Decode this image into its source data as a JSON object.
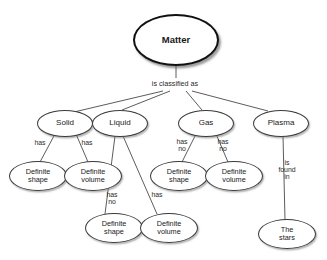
{
  "diagram": {
    "background_color": "#ffffff",
    "node_border_color": "#3a3a3a",
    "root_border_color": "#111111",
    "text_color": "#1a1a1a",
    "nodes": [
      {
        "id": "matter",
        "label": "Matter",
        "x": 133,
        "y": 14,
        "w": 86,
        "h": 52,
        "font_size": 9.5,
        "root": true
      },
      {
        "id": "solid",
        "label": "Solid",
        "x": 37,
        "y": 110,
        "w": 56,
        "h": 27,
        "font_size": 8.0,
        "root": false
      },
      {
        "id": "liquid",
        "label": "Liquid",
        "x": 92,
        "y": 110,
        "w": 56,
        "h": 27,
        "font_size": 8.0,
        "root": false
      },
      {
        "id": "gas",
        "label": "Gas",
        "x": 178,
        "y": 110,
        "w": 56,
        "h": 27,
        "font_size": 8.0,
        "root": false
      },
      {
        "id": "plasma",
        "label": "Plasma",
        "x": 253,
        "y": 110,
        "w": 56,
        "h": 27,
        "font_size": 8.0,
        "root": false
      },
      {
        "id": "solid-shape",
        "label": "Definite\nshape",
        "x": 9,
        "y": 161,
        "w": 58,
        "h": 30,
        "font_size": 7.3,
        "root": false
      },
      {
        "id": "solid-volume",
        "label": "Definite\nvolume",
        "x": 64,
        "y": 161,
        "w": 58,
        "h": 30,
        "font_size": 7.3,
        "root": false
      },
      {
        "id": "gas-shape",
        "label": "Definite\nshape",
        "x": 150,
        "y": 161,
        "w": 58,
        "h": 30,
        "font_size": 7.3,
        "root": false
      },
      {
        "id": "gas-volume",
        "label": "Definite\nvolume",
        "x": 205,
        "y": 161,
        "w": 58,
        "h": 30,
        "font_size": 7.3,
        "root": false
      },
      {
        "id": "liquid-shape",
        "label": "Definite\nshape",
        "x": 85,
        "y": 213,
        "w": 58,
        "h": 30,
        "font_size": 7.3,
        "root": false
      },
      {
        "id": "liquid-volume",
        "label": "Definite\nvolume",
        "x": 140,
        "y": 213,
        "w": 58,
        "h": 30,
        "font_size": 7.3,
        "root": false
      },
      {
        "id": "stars",
        "label": "The\nstars",
        "x": 258,
        "y": 219,
        "w": 58,
        "h": 30,
        "font_size": 7.3,
        "root": false
      }
    ],
    "edge_labels": [
      {
        "id": "classified",
        "text": "is classified as",
        "x": 139,
        "y": 80,
        "w": 72,
        "font_size": 7.2
      },
      {
        "id": "solid-has-1",
        "text": "has",
        "x": 29,
        "y": 140,
        "w": 22,
        "font_size": 6.9
      },
      {
        "id": "solid-has-2",
        "text": "has",
        "x": 76,
        "y": 140,
        "w": 22,
        "font_size": 6.9
      },
      {
        "id": "gas-hasno-1",
        "text": "has\nno",
        "x": 171,
        "y": 139,
        "w": 22,
        "font_size": 6.9
      },
      {
        "id": "gas-hasno-2",
        "text": "has\nno",
        "x": 212,
        "y": 139,
        "w": 22,
        "font_size": 6.9
      },
      {
        "id": "liquid-hasno",
        "text": "has\nno",
        "x": 101,
        "y": 192,
        "w": 22,
        "font_size": 6.9
      },
      {
        "id": "liquid-has",
        "text": "has",
        "x": 146,
        "y": 192,
        "w": 22,
        "font_size": 6.9
      },
      {
        "id": "plasma-found",
        "text": "is\nfound\nin",
        "x": 274,
        "y": 160,
        "w": 26,
        "font_size": 6.9
      }
    ],
    "edges": [
      {
        "id": "matter-to-hub",
        "from": "matter",
        "to": "classified-label",
        "x1": 176,
        "y1": 66,
        "x2": 176,
        "y2": 78
      },
      {
        "id": "hub-to-solid",
        "from": "hub",
        "to": "solid",
        "x1": 163,
        "y1": 91,
        "x2": 74,
        "y2": 112
      },
      {
        "id": "hub-to-liquid",
        "from": "hub",
        "to": "liquid",
        "x1": 170,
        "y1": 91,
        "x2": 122,
        "y2": 110
      },
      {
        "id": "hub-to-gas",
        "from": "hub",
        "to": "gas",
        "x1": 186,
        "y1": 91,
        "x2": 202,
        "y2": 110
      },
      {
        "id": "hub-to-plasma",
        "from": "hub",
        "to": "plasma",
        "x1": 192,
        "y1": 91,
        "x2": 268,
        "y2": 111
      },
      {
        "id": "solid-to-shape",
        "from": "solid",
        "to": "solid-shape",
        "x1": 55,
        "y1": 134,
        "x2": 40,
        "y2": 162
      },
      {
        "id": "solid-to-volume",
        "from": "solid",
        "to": "solid-volume",
        "x1": 76,
        "y1": 134,
        "x2": 88,
        "y2": 162
      },
      {
        "id": "liquid-to-shape",
        "from": "liquid",
        "to": "liquid-shape",
        "x1": 115,
        "y1": 136,
        "x2": 105,
        "y2": 214
      },
      {
        "id": "liquid-to-volume",
        "from": "liquid",
        "to": "liquid-volume",
        "x1": 123,
        "y1": 136,
        "x2": 157,
        "y2": 214
      },
      {
        "id": "gas-to-shape",
        "from": "gas",
        "to": "gas-shape",
        "x1": 196,
        "y1": 134,
        "x2": 182,
        "y2": 162
      },
      {
        "id": "gas-to-volume",
        "from": "gas",
        "to": "gas-volume",
        "x1": 216,
        "y1": 134,
        "x2": 228,
        "y2": 162
      },
      {
        "id": "plasma-to-stars",
        "from": "plasma",
        "to": "stars",
        "x1": 283,
        "y1": 136,
        "x2": 285,
        "y2": 220
      }
    ]
  }
}
